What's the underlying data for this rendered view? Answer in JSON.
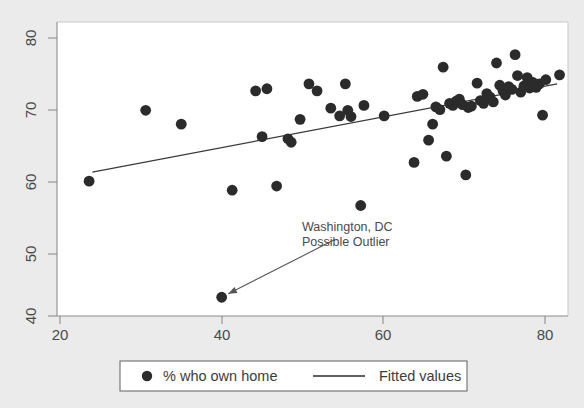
{
  "figure": {
    "background_color": "#ebebeb",
    "plot_background_color": "#ffffff",
    "marker_color": "#2b2b2b",
    "line_color": "#3a3a3a",
    "axis_color": "#8c8c8c"
  },
  "chart_data": {
    "type": "scatter",
    "title": "",
    "xlabel": "",
    "ylabel": "",
    "xlim": [
      18,
      83
    ],
    "ylim": [
      38,
      82
    ],
    "xticks": [
      20,
      40,
      60,
      80
    ],
    "yticks": [
      40,
      50,
      60,
      70,
      80
    ],
    "xtick_labels": [
      "20",
      "40",
      "60",
      "80"
    ],
    "ytick_labels": [
      "40",
      "50",
      "60",
      "70",
      "80"
    ],
    "grid": false,
    "legend_position": "below-plot",
    "series": [
      {
        "name": "% who own home",
        "type": "scatter",
        "marker": "circle",
        "color": "#2b2b2b",
        "points": [
          [
            23.6,
            59.4
          ],
          [
            30.6,
            69.6
          ],
          [
            35.0,
            67.6
          ],
          [
            40.0,
            42.7
          ],
          [
            41.3,
            58.1
          ],
          [
            44.2,
            72.4
          ],
          [
            45.0,
            65.8
          ],
          [
            45.6,
            72.7
          ],
          [
            46.8,
            58.7
          ],
          [
            48.2,
            65.5
          ],
          [
            48.6,
            65.0
          ],
          [
            49.7,
            68.3
          ],
          [
            50.8,
            73.4
          ],
          [
            51.8,
            72.4
          ],
          [
            53.5,
            69.9
          ],
          [
            54.6,
            68.8
          ],
          [
            55.3,
            73.4
          ],
          [
            55.6,
            69.6
          ],
          [
            56.0,
            68.7
          ],
          [
            57.2,
            55.9
          ],
          [
            57.6,
            70.3
          ],
          [
            60.1,
            68.8
          ],
          [
            63.8,
            62.1
          ],
          [
            64.2,
            71.6
          ],
          [
            64.9,
            71.9
          ],
          [
            65.6,
            65.3
          ],
          [
            66.1,
            67.6
          ],
          [
            66.5,
            70.1
          ],
          [
            67.0,
            69.7
          ],
          [
            67.4,
            75.8
          ],
          [
            67.8,
            63.0
          ],
          [
            68.2,
            70.6
          ],
          [
            68.6,
            70.3
          ],
          [
            69.0,
            70.9
          ],
          [
            69.4,
            71.2
          ],
          [
            69.8,
            70.4
          ],
          [
            70.2,
            60.3
          ],
          [
            70.5,
            70.0
          ],
          [
            70.9,
            70.2
          ],
          [
            71.6,
            73.5
          ],
          [
            72.0,
            71.0
          ],
          [
            72.4,
            70.6
          ],
          [
            72.8,
            72.0
          ],
          [
            73.2,
            71.5
          ],
          [
            73.6,
            70.8
          ],
          [
            74.0,
            76.4
          ],
          [
            74.4,
            73.2
          ],
          [
            74.8,
            72.4
          ],
          [
            75.1,
            71.8
          ],
          [
            75.5,
            73.0
          ],
          [
            75.9,
            72.6
          ],
          [
            76.3,
            77.6
          ],
          [
            76.6,
            74.6
          ],
          [
            77.0,
            72.2
          ],
          [
            77.4,
            73.1
          ],
          [
            77.8,
            74.3
          ],
          [
            78.1,
            72.8
          ],
          [
            78.5,
            73.6
          ],
          [
            78.9,
            72.9
          ],
          [
            79.3,
            73.4
          ],
          [
            79.7,
            68.9
          ],
          [
            80.1,
            74.0
          ],
          [
            81.8,
            74.7
          ]
        ]
      },
      {
        "name": "Fitted values",
        "type": "line",
        "color": "#3a3a3a",
        "x_range": [
          24.0,
          81.5
        ],
        "y_range": [
          60.7,
          73.4
        ]
      }
    ],
    "annotations": [
      {
        "name": "washington-dc-outlier",
        "line1": "Washington, DC",
        "line2": "Possible Outlier",
        "text_x": 54.0,
        "text_y": 51.0,
        "target_x": 40.0,
        "target_y": 42.7
      }
    ]
  },
  "legend": {
    "entries": [
      {
        "label": "% who own home",
        "marker": "circle"
      },
      {
        "label": "Fitted values",
        "marker": "line"
      }
    ]
  }
}
